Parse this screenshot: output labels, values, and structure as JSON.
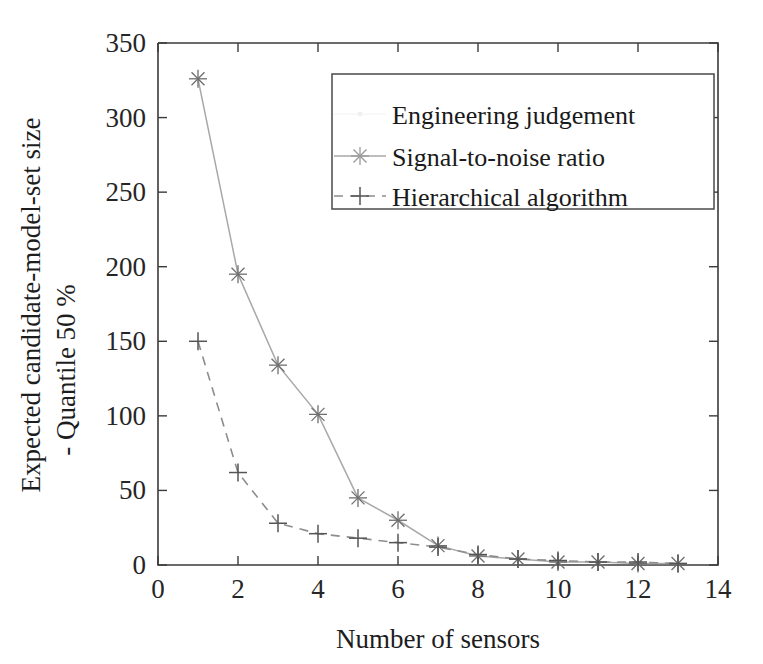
{
  "chart_data": {
    "type": "line",
    "title": "",
    "xlabel": "Number of sensors",
    "ylabel_line1": "Expected candidate-model-set size",
    "ylabel_line2": "- Quantile 50 %",
    "xlim": [
      0,
      14
    ],
    "ylim": [
      0,
      350
    ],
    "xticks": [
      0,
      2,
      4,
      6,
      8,
      10,
      12,
      14
    ],
    "yticks": [
      0,
      50,
      100,
      150,
      200,
      250,
      300,
      350
    ],
    "xticklabels": [
      "0",
      "2",
      "4",
      "6",
      "8",
      "10",
      "12",
      "14"
    ],
    "yticklabels": [
      "0",
      "50",
      "100",
      "150",
      "200",
      "250",
      "300",
      "350"
    ],
    "grid": false,
    "legend_position": "upper right inside",
    "series": [
      {
        "name": "Engineering judgement",
        "marker": "none",
        "linestyle": "solid",
        "color": "#f4f4f4",
        "visible_in_plot": false,
        "x": [],
        "values": []
      },
      {
        "name": "Signal-to-noise ratio",
        "marker": "star",
        "linestyle": "solid",
        "color": "#a8a8a8",
        "visible_in_plot": true,
        "x": [
          1,
          2,
          3,
          4,
          5,
          6,
          7,
          8,
          9,
          10,
          11,
          12,
          13
        ],
        "values": [
          326,
          195,
          134,
          101,
          45,
          30,
          13,
          6,
          4,
          2,
          2,
          1,
          1
        ]
      },
      {
        "name": "Hierarchical algorithm",
        "marker": "plus",
        "linestyle": "dashed",
        "color": "#8d8d8d",
        "visible_in_plot": true,
        "x": [
          1,
          2,
          3,
          4,
          5,
          6,
          7,
          8,
          9,
          10,
          11,
          12,
          13
        ],
        "values": [
          150,
          62,
          28,
          21,
          18,
          15,
          12,
          7,
          4,
          3,
          2,
          2,
          1
        ]
      }
    ]
  },
  "legend": {
    "entries": [
      {
        "label": "Engineering judgement"
      },
      {
        "label": "Signal-to-noise ratio"
      },
      {
        "label": "Hierarchical algorithm"
      }
    ]
  }
}
